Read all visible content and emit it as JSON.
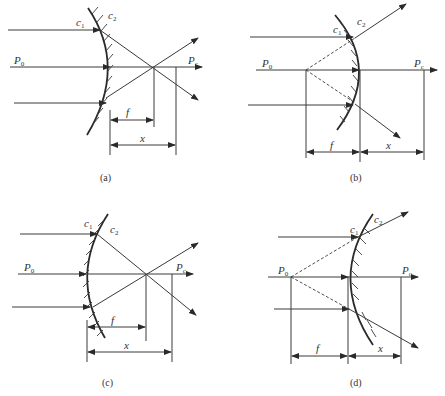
{
  "figure": {
    "panels": [
      {
        "id": "a",
        "caption": "(a)",
        "labels": {
          "c1": "c",
          "c1_sub": "1",
          "c2": "c",
          "c2_sub": "2",
          "p0": "P",
          "p0_sub": "0",
          "pc": "P",
          "pc_sub": "c",
          "f": "f",
          "x": "x"
        }
      },
      {
        "id": "b",
        "caption": "(b)",
        "labels": {
          "c1": "c",
          "c1_sub": "1",
          "c2": "c",
          "c2_sub": "2",
          "p0": "P",
          "p0_sub": "0",
          "pc": "P",
          "pc_sub": "c",
          "f": "f",
          "x": "x"
        }
      },
      {
        "id": "c",
        "caption": "(c)",
        "labels": {
          "c1": "c",
          "c1_sub": "1",
          "c2": "c",
          "c2_sub": "2",
          "p0": "P",
          "p0_sub": "0",
          "pc": "P",
          "pc_sub": "c",
          "f": "f",
          "x": "x"
        }
      },
      {
        "id": "d",
        "caption": "(d)",
        "labels": {
          "c1": "c",
          "c1_sub": "1",
          "c2": "c",
          "c2_sub": "2",
          "p0": "P",
          "p0_sub": "0",
          "pc": "P",
          "pc_sub": "c",
          "f": "f",
          "x": "x"
        }
      }
    ]
  }
}
